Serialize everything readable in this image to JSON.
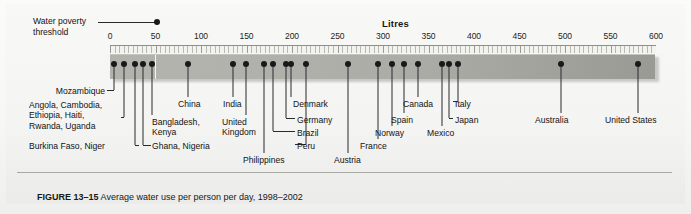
{
  "figure": {
    "axis_title": "Litres",
    "caption_label": "FIGURE 13–15",
    "caption_text": " Average water use per person per day, 1998–2002"
  },
  "threshold": {
    "label_line1": "Water poverty",
    "label_line2": "threshold",
    "value": 50
  },
  "chart_data": {
    "type": "scatter",
    "title": "Average water use per person per day, 1998–2002",
    "xlabel": "Litres",
    "ylabel": "",
    "xlim": [
      0,
      600
    ],
    "xticks": [
      0,
      50,
      100,
      150,
      200,
      250,
      300,
      350,
      400,
      450,
      500,
      550,
      600
    ],
    "grid": false,
    "legend": "none",
    "annotations": [
      {
        "label": "Water poverty threshold",
        "value": 50
      }
    ],
    "points": [
      {
        "label": "Mozambique",
        "value": 4
      },
      {
        "label": "Angola, Cambodia, Ethiopia, Haiti, Rwanda, Uganda",
        "value": 15
      },
      {
        "label": "Burkina Faso, Niger",
        "value": 27
      },
      {
        "label": "Ghana, Nigeria",
        "value": 36
      },
      {
        "label": "Bangladesh, Kenya",
        "value": 46
      },
      {
        "label": "China",
        "value": 86
      },
      {
        "label": "India",
        "value": 135
      },
      {
        "label": "United Kingdom",
        "value": 149
      },
      {
        "label": "Philippines",
        "value": 169
      },
      {
        "label": "Brazil",
        "value": 179
      },
      {
        "label": "Germany",
        "value": 193
      },
      {
        "label": "Denmark",
        "value": 199
      },
      {
        "label": "Peru",
        "value": 215
      },
      {
        "label": "Austria",
        "value": 262
      },
      {
        "label": "France",
        "value": 295
      },
      {
        "label": "Norway",
        "value": 310
      },
      {
        "label": "Spain",
        "value": 323
      },
      {
        "label": "Canada",
        "value": 339
      },
      {
        "label": "Mexico",
        "value": 365
      },
      {
        "label": "Japan",
        "value": 372
      },
      {
        "label": "Italy",
        "value": 382
      },
      {
        "label": "Australia",
        "value": 496
      },
      {
        "label": "United States",
        "value": 580
      }
    ]
  },
  "axis_ticks": [
    {
      "label": "0",
      "value": 0
    },
    {
      "label": "50",
      "value": 50
    },
    {
      "label": "100",
      "value": 100
    },
    {
      "label": "150",
      "value": 150
    },
    {
      "label": "200",
      "value": 200
    },
    {
      "label": "250",
      "value": 250
    },
    {
      "label": "300",
      "value": 300
    },
    {
      "label": "350",
      "value": 350
    },
    {
      "label": "400",
      "value": 400
    },
    {
      "label": "450",
      "value": 450
    },
    {
      "label": "500",
      "value": 500
    },
    {
      "label": "550",
      "value": 550
    },
    {
      "label": "600",
      "value": 600
    }
  ],
  "callouts": [
    {
      "name": "mozambique",
      "text": "Mozambique",
      "x": 105,
      "y": 86,
      "align": "right"
    },
    {
      "name": "angola-group",
      "text": "Angola, Cambodia,\nEthiopia, Haiti,\nRwanda, Uganda",
      "x": 29,
      "y": 100,
      "align": "left"
    },
    {
      "name": "burkina-niger",
      "text": "Burkina Faso, Niger",
      "x": 29,
      "y": 141,
      "align": "left"
    },
    {
      "name": "ghana-nigeria",
      "text": "Ghana, Nigeria",
      "x": 152,
      "y": 141,
      "align": "left"
    },
    {
      "name": "bangladesh-kenya",
      "text": "Bangladesh,\nKenya",
      "x": 152,
      "y": 117,
      "align": "left"
    },
    {
      "name": "china",
      "text": "China",
      "x": 178,
      "y": 99,
      "align": "left"
    },
    {
      "name": "india",
      "text": "India",
      "x": 223,
      "y": 99,
      "align": "left"
    },
    {
      "name": "united-kingdom",
      "text": "United\nKingdom",
      "x": 222,
      "y": 117,
      "align": "left"
    },
    {
      "name": "philippines",
      "text": "Philippines",
      "x": 243,
      "y": 155,
      "align": "left"
    },
    {
      "name": "peru",
      "text": "Peru",
      "x": 297,
      "y": 141,
      "align": "left"
    },
    {
      "name": "brazil",
      "text": "Brazil",
      "x": 297,
      "y": 128,
      "align": "left"
    },
    {
      "name": "germany",
      "text": "Germany",
      "x": 297,
      "y": 115,
      "align": "left"
    },
    {
      "name": "denmark",
      "text": "Denmark",
      "x": 293,
      "y": 99,
      "align": "left"
    },
    {
      "name": "austria",
      "text": "Austria",
      "x": 334,
      "y": 155,
      "align": "left"
    },
    {
      "name": "france",
      "text": "France",
      "x": 360,
      "y": 141,
      "align": "left"
    },
    {
      "name": "norway",
      "text": "Norway",
      "x": 375,
      "y": 128,
      "align": "left"
    },
    {
      "name": "spain",
      "text": "Spain",
      "x": 391,
      "y": 115,
      "align": "left"
    },
    {
      "name": "canada",
      "text": "Canada",
      "x": 403,
      "y": 99,
      "align": "left"
    },
    {
      "name": "mexico",
      "text": "Mexico",
      "x": 427,
      "y": 128,
      "align": "left"
    },
    {
      "name": "japan",
      "text": "Japan",
      "x": 455,
      "y": 115,
      "align": "left"
    },
    {
      "name": "italy",
      "text": "Italy",
      "x": 455,
      "y": 99,
      "align": "left"
    },
    {
      "name": "australia",
      "text": "Australia",
      "x": 535,
      "y": 115,
      "align": "left"
    },
    {
      "name": "united-states",
      "text": "United States",
      "x": 605,
      "y": 115,
      "align": "left"
    }
  ]
}
